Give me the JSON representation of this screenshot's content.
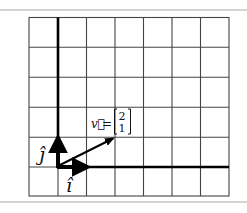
{
  "diagram": {
    "type": "basis-vector-grid",
    "grid": {
      "columns": 7,
      "rows": 6,
      "origin_column": 1,
      "origin_row_from_bottom": 1
    },
    "basis_vectors": [
      {
        "name": "i-hat",
        "label": "î",
        "components": [
          1,
          0
        ]
      },
      {
        "name": "j-hat",
        "label": "ĵ",
        "components": [
          0,
          1
        ]
      }
    ],
    "vector": {
      "name": "v",
      "label": "v⃗",
      "equals": "=",
      "components": [
        2,
        1
      ],
      "top_entry": "2",
      "bottom_entry": "1"
    },
    "colors": {
      "grid": "#444444",
      "axes": "#000000",
      "frame": "#d4d4d4"
    }
  }
}
